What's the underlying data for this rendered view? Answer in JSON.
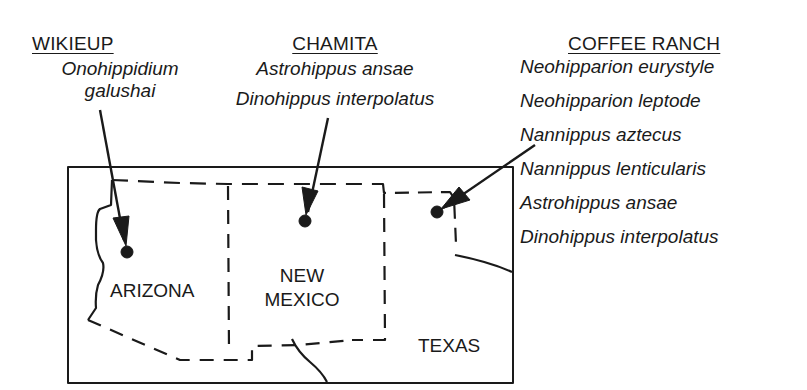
{
  "sites": [
    {
      "name": "WIKIEUP",
      "taxa": [
        "Onohippidium",
        "galushai"
      ],
      "state": "ARIZONA"
    },
    {
      "name": "CHAMITA",
      "taxa": [
        "Astrohippus ansae",
        "Dinohippus interpolatus"
      ],
      "state": "NEW MEXICO"
    },
    {
      "name": "COFFEE RANCH",
      "taxa": [
        "Neohipparion eurystyle",
        "Neohipparion leptode",
        "Nannippus aztecus",
        "Nannippus lenticularis",
        "Astrohippus ansae",
        "Dinohippus interpolatus"
      ],
      "state": "TEXAS"
    }
  ],
  "map": {
    "states": {
      "arizona": "ARIZONA",
      "new_mexico_line1": "NEW",
      "new_mexico_line2": "MEXICO",
      "texas": "TEXAS"
    },
    "line_color": "#1a1a1a"
  }
}
